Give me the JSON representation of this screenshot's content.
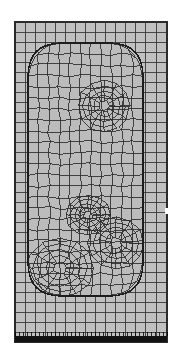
{
  "figure": {
    "kind": "finite-element-mesh",
    "title": "",
    "caption": "",
    "domain_shape": "rectangle",
    "embedded_region_shape": "rounded-rectangle",
    "element_type": "quadrilateral",
    "colors": {
      "background": "#ffffff",
      "element_fill": "#c0c0c0",
      "element_fill_inner": "#bcbcbc",
      "mesh_line": "#3a3a3a",
      "mesh_line_inner": "#2a2a2a",
      "outer_border": "#2b2b2b",
      "fixed_boundary_band": "#121212",
      "notch": "#ffffff"
    }
  },
  "chart_data": {
    "type": "mesh",
    "title": "",
    "xlabel": "",
    "ylabel": "",
    "grid": true,
    "legend": null,
    "outer_domain": {
      "x0": 15,
      "y0": 22,
      "x1": 167,
      "y1": 342,
      "width": 152,
      "height": 320,
      "background_columns": 15,
      "background_rows": 32
    },
    "background_grid": {
      "x_lines": [
        15,
        25,
        35,
        45,
        55,
        65,
        75,
        85,
        95,
        105,
        115,
        125,
        135,
        145,
        156,
        167
      ],
      "y_lines": [
        22,
        32,
        42,
        52,
        62,
        72,
        82,
        92,
        102,
        112,
        122,
        132,
        142,
        152,
        162,
        172,
        182,
        192,
        202,
        212,
        222,
        232,
        242,
        252,
        262,
        272,
        282,
        292,
        302,
        312,
        322,
        332,
        342
      ]
    },
    "inner_region": {
      "shape": "rounded-rectangle",
      "x0": 28,
      "y0": 43,
      "x1": 143,
      "y1": 296,
      "corner_radius": 34,
      "mesh_style": "mapped-radial-transition"
    },
    "interior_features": [
      {
        "name": "upper-cavity",
        "description": "re-entrant mesh transition below the top rounded cap",
        "cx": 104,
        "cy": 106,
        "rx": 26,
        "ry": 26
      },
      {
        "name": "mid-transition-node",
        "description": "irregular quad transition / singular node cluster",
        "cx": 88,
        "cy": 215,
        "rx": 22,
        "ry": 20
      },
      {
        "name": "lower-cavity",
        "description": "radial graded mesh around the lower-left rounded cap",
        "cx": 60,
        "cy": 268,
        "rx": 34,
        "ry": 30
      },
      {
        "name": "lower-right-swirl",
        "description": "radial graded mesh around the lower-right feature",
        "cx": 116,
        "cy": 243,
        "rx": 28,
        "ry": 26
      }
    ],
    "boundary_conditions": [
      {
        "name": "fixed-support",
        "edge": "bottom",
        "x0": 15,
        "x1": 167,
        "y": 336,
        "thickness": 6,
        "render": "solid-dark-band"
      }
    ],
    "annotations": [
      {
        "name": "right-edge-notch",
        "x": 165,
        "y": 208,
        "width": 4,
        "height": 6,
        "color": "#ffffff"
      }
    ]
  }
}
